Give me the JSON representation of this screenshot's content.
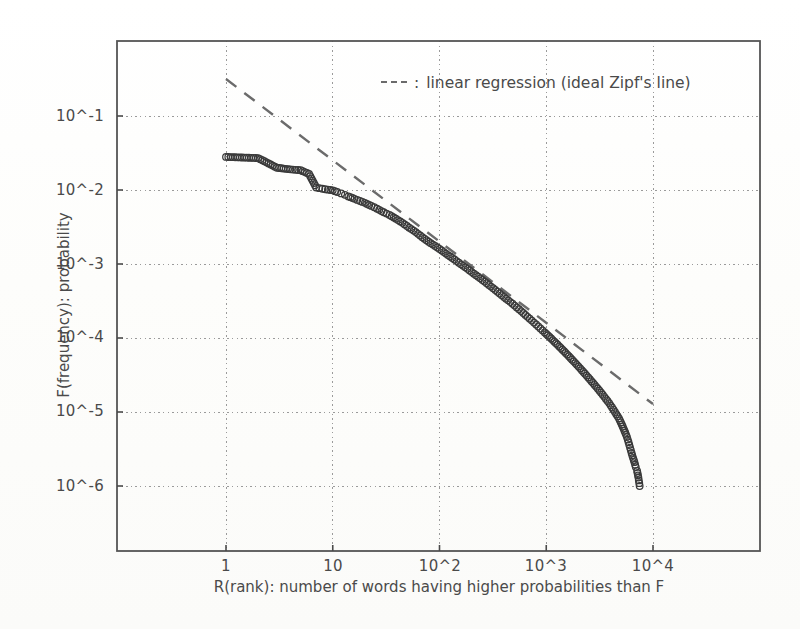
{
  "figure": {
    "background_color": "#fdfdfc",
    "frame_color": "#555555"
  },
  "legend": {
    "dash_marker": "----",
    "separator": ":",
    "label": "linear regression (ideal Zipf's line)",
    "full_text": "---- : linear regression (ideal Zipf's line)",
    "position": "top-center-right"
  },
  "chart_data": {
    "type": "scatter",
    "title": "",
    "xlabel": "R(rank): number of words having higher probabilities than F",
    "ylabel": "F(frequency): probability",
    "xscale": "log",
    "yscale": "log",
    "xlim": [
      0.18,
      30000
    ],
    "ylim": [
      1e-07,
      0.55
    ],
    "grid": true,
    "grid_style": "dotted",
    "xtick_labels": [
      "1",
      "10",
      "10^2",
      "10^3",
      "10^4"
    ],
    "xtick_values": [
      1,
      10,
      100,
      1000,
      10000
    ],
    "ytick_labels": [
      "10^-1",
      "10^-2",
      "10^-3",
      "10^-4",
      "10^-5",
      "10^-6"
    ],
    "ytick_values": [
      0.1,
      0.01,
      0.001,
      0.0001,
      1e-05,
      1e-06
    ],
    "series": [
      {
        "name": "empirical word frequency distribution",
        "type": "scatter",
        "marker": "open-circle",
        "marker_color": "#3a3a3a",
        "x": [
          1,
          2,
          3,
          4,
          5,
          6,
          7,
          8,
          9,
          10,
          11,
          12,
          13,
          14,
          16,
          18,
          20,
          23,
          26,
          30,
          34,
          39,
          45,
          52,
          60,
          69,
          79,
          91,
          105,
          120,
          138,
          159,
          183,
          210,
          241,
          277,
          318,
          366,
          420,
          483,
          555,
          638,
          733,
          842,
          968,
          1112,
          1278,
          1468,
          1687,
          1939,
          2228,
          2560,
          2942,
          3381,
          3885,
          4400,
          4800,
          5100,
          5400,
          5700,
          5900,
          6100,
          6300,
          6500,
          6700,
          6900,
          7100,
          7300,
          7500
        ],
        "y": [
          0.028,
          0.027,
          0.02,
          0.019,
          0.0185,
          0.0165,
          0.0108,
          0.0104,
          0.0101,
          0.0099,
          0.0094,
          0.009,
          0.0086,
          0.0082,
          0.0076,
          0.0071,
          0.0067,
          0.0061,
          0.0056,
          0.005,
          0.0046,
          0.0041,
          0.0036,
          0.0031,
          0.0027,
          0.0023,
          0.002,
          0.00175,
          0.00152,
          0.00132,
          0.00115,
          0.00099,
          0.00086,
          0.00074,
          0.00064,
          0.00055,
          0.00047,
          0.0004,
          0.00034,
          0.00029,
          0.000245,
          0.000205,
          0.000172,
          0.000143,
          0.000119,
          9.85e-05,
          8.1e-05,
          6.62e-05,
          5.38e-05,
          4.34e-05,
          3.48e-05,
          2.77e-05,
          2.19e-05,
          1.71e-05,
          1.32e-05,
          1e-05,
          8.2e-06,
          6.8e-06,
          5.6e-06,
          4.6e-06,
          3.9e-06,
          3.3e-06,
          2.8e-06,
          2.4e-06,
          2.1e-06,
          1.8e-06,
          1.6e-06,
          1.3e-06,
          1e-06
        ]
      },
      {
        "name": "linear regression (ideal Zipf's line)",
        "type": "line",
        "style": "dashed",
        "color": "#6b6b6b",
        "x": [
          1,
          10000
        ],
        "y": [
          0.316,
          1.28e-05
        ],
        "slope": -1.075,
        "intercept_log10": -0.5
      }
    ]
  }
}
